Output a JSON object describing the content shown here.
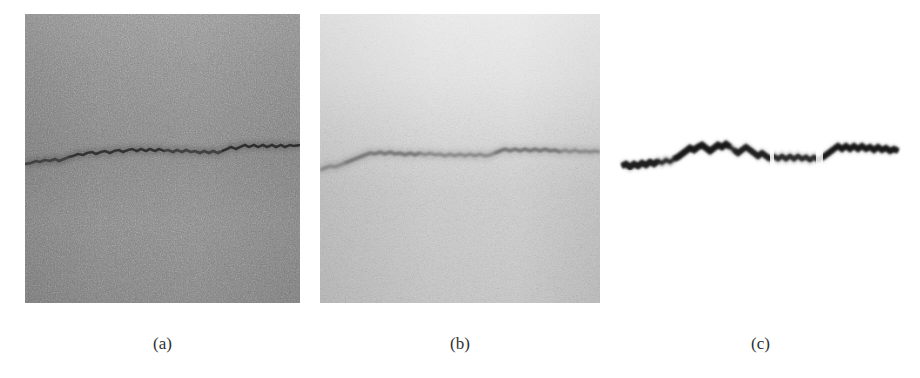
{
  "figure": {
    "panel_count": 3,
    "background_color": "#ffffff",
    "panels": [
      {
        "id": "a",
        "caption": "(a)",
        "role": "original-noisy-image",
        "description": "Noisy grey-scale micrograph containing a dark horizontal crack",
        "base_gray": "#878787",
        "crack_color": "#3c3c3c",
        "x": 25,
        "y": 14,
        "width": 275,
        "height": 289
      },
      {
        "id": "b",
        "caption": "(b)",
        "role": "filtered-brightened-image",
        "description": "Same scene after processing: brighter background, lower-contrast crack",
        "base_gray": "#cfcfcf",
        "crack_color": "#8f8f8f",
        "x": 320,
        "y": 14,
        "width": 280,
        "height": 289
      },
      {
        "id": "c",
        "caption": "(c)",
        "role": "extracted-edge-map",
        "description": "Extracted crack edge rendered as a dark jagged curve on white",
        "base_gray": "#ffffff",
        "crack_color": "#202020",
        "x": 618,
        "y": 14,
        "width": 285,
        "height": 289
      }
    ]
  },
  "chart_data": {
    "type": "line",
    "title": "",
    "xlabel": "",
    "ylabel": "",
    "grid": false,
    "legend_position": "none",
    "xlim": [
      0,
      275
    ],
    "ylim": [
      0,
      289
    ],
    "series": [
      {
        "name": "crack-profile",
        "comment": "Vertical pixel position of the crack centre-line sampled across the panel width",
        "x": [
          0,
          8,
          16,
          24,
          32,
          40,
          48,
          56,
          64,
          72,
          80,
          88,
          96,
          104,
          112,
          120,
          128,
          136,
          144,
          152,
          160,
          168,
          176,
          184,
          192,
          200,
          208,
          216,
          224,
          232,
          240,
          248,
          256,
          264,
          272
        ],
        "y": [
          150,
          148,
          146,
          147,
          144,
          142,
          140,
          138,
          136,
          133,
          131,
          134,
          132,
          130,
          133,
          131,
          134,
          132,
          135,
          133,
          136,
          134,
          137,
          135,
          138,
          136,
          134,
          132,
          130,
          133,
          131,
          129,
          132,
          130,
          131
        ]
      }
    ]
  },
  "captions": {
    "a": "(a)",
    "b": "(b)",
    "c": "(c)"
  }
}
